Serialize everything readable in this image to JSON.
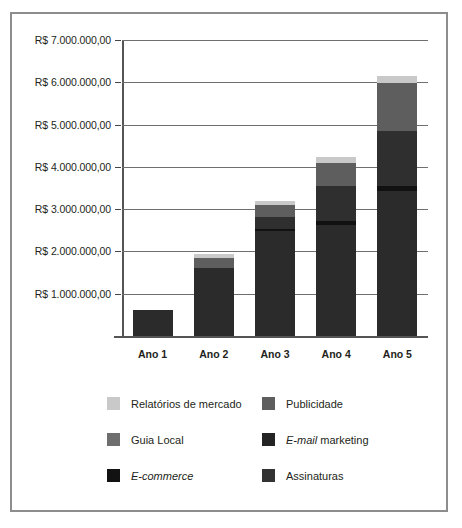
{
  "chart_data": {
    "type": "bar",
    "stacked": true,
    "title": "",
    "xlabel": "",
    "ylabel": "",
    "categories": [
      "Ano 1",
      "Ano 2",
      "Ano 3",
      "Ano 4",
      "Ano 5"
    ],
    "ylim": [
      0,
      7000000
    ],
    "ytick_values": [
      1000000,
      2000000,
      3000000,
      4000000,
      5000000,
      6000000,
      7000000
    ],
    "ytick_labels": [
      "R$ 1.000.000,00",
      "R$ 2.000.000,00",
      "R$ 3.000.000,00",
      "R$ 4.000.000,00",
      "R$ 5.000.000,00",
      "R$ 6.000.000,00",
      "R$ 7.000.000,00"
    ],
    "grid": true,
    "legend_position": "bottom",
    "series": [
      {
        "name": "Assinaturas",
        "name_parts": [
          {
            "text": "Assinaturas",
            "italic": false
          }
        ],
        "color": "#2b2b2b",
        "values": [
          620000,
          1620000,
          2480000,
          2620000,
          3440000
        ]
      },
      {
        "name": "E-commerce",
        "name_parts": [
          {
            "text": "E-commerce",
            "italic": true
          }
        ],
        "color": "#151515",
        "values": [
          0,
          0,
          0,
          0,
          0
        ]
      },
      {
        "name": "E-mail marketing",
        "name_parts": [
          {
            "text": "E-mail",
            "italic": true
          },
          {
            "text": " marketing",
            "italic": false
          }
        ],
        "color": "#111111",
        "values": [
          0,
          0,
          60000,
          90000,
          110000
        ]
      },
      {
        "name": "Guia Local",
        "name_parts": [
          {
            "text": "Guia Local",
            "italic": false
          }
        ],
        "color": "#2f2f2f",
        "values": [
          0,
          0,
          280000,
          840000,
          1290000
        ]
      },
      {
        "name": "Publicidade",
        "name_parts": [
          {
            "text": "Publicidade",
            "italic": false
          }
        ],
        "color": "#5e5e5e",
        "values": [
          0,
          230000,
          270000,
          540000,
          1140000
        ]
      },
      {
        "name": "Relatórios de mercado",
        "name_parts": [
          {
            "text": "Relatórios de mercado",
            "italic": false
          }
        ],
        "color": "#c9c9c9",
        "values": [
          0,
          80000,
          100000,
          140000,
          180000
        ]
      }
    ],
    "totals": [
      620000,
      1930000,
      3190000,
      4230000,
      6160000
    ]
  },
  "legend": {
    "items": [
      {
        "label": "Relatórios de mercado",
        "color": "#c9c9c9"
      },
      {
        "label": "Publicidade",
        "color": "#5e5e5e"
      },
      {
        "label": "Guia Local",
        "color": "#6e6e6e"
      },
      {
        "label": "E-mail marketing",
        "color": "#242424"
      },
      {
        "label": "E-commerce",
        "color": "#121212"
      },
      {
        "label": "Assinaturas",
        "color": "#333333"
      }
    ]
  },
  "style": {
    "border_color": "#8d8d8d",
    "grid_color": "#6f6f6f",
    "axis_color": "#555555",
    "text_color": "#231f20",
    "background": "#ffffff"
  }
}
